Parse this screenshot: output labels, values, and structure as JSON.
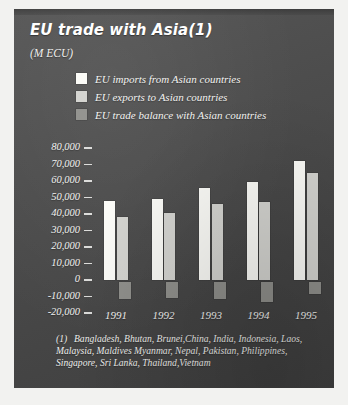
{
  "chart_data": {
    "type": "bar",
    "title": "EU trade with Asia(1)",
    "subtitle": "(M ECU)",
    "xlabel": "",
    "ylabel": "M ECU",
    "categories": [
      "1991",
      "1992",
      "1993",
      "1994",
      "1995"
    ],
    "series": [
      {
        "name": "EU imports from Asian countries",
        "values": [
          48000,
          49000,
          56000,
          59500,
          72000
        ],
        "color": "#fbfbf7"
      },
      {
        "name": "EU exports to Asian countries",
        "values": [
          38000,
          40500,
          46000,
          47000,
          65000
        ],
        "color": "#d3d3cf"
      },
      {
        "name": "EU trade balance with Asian countries",
        "values": [
          -10000,
          -9500,
          -10000,
          -12000,
          -7000
        ],
        "color": "#8f8f8b"
      }
    ],
    "ylim": [
      -20000,
      80000
    ],
    "ytick_labels": [
      "80,000",
      "70,000",
      "60,000",
      "50,000",
      "40,000",
      "30,000",
      "20,000",
      "10,000",
      "0",
      "-10,000",
      "-20,000"
    ],
    "ytick_values": [
      80000,
      70000,
      60000,
      50000,
      40000,
      30000,
      20000,
      10000,
      0,
      -10000,
      -20000
    ],
    "grid": false,
    "legend_position": "top"
  },
  "legend": {
    "items": [
      {
        "label": "EU imports from Asian countries",
        "color": "#fbfbf7"
      },
      {
        "label": "EU exports to Asian countries",
        "color": "#d3d3cf"
      },
      {
        "label": "EU trade balance with Asian countries",
        "color": "#8f8f8b"
      }
    ]
  },
  "footnote": {
    "marker": "(1)",
    "text": "Bangladesh, Bhutan, Brunei,China, India, Indonesia, Laos, Malaysia, Maldives Myanmar, Nepal, Pakistan, Philippines, Singapore, Sri Lanka, Thailand,Vietnam"
  },
  "colors": {
    "panel_background": "#4a4a4a",
    "page_background": "#f2f2f0",
    "text": "#f3f3f1",
    "imports": "#fbfbf7",
    "exports": "#d3d3cf",
    "balance": "#8f8f8b"
  }
}
